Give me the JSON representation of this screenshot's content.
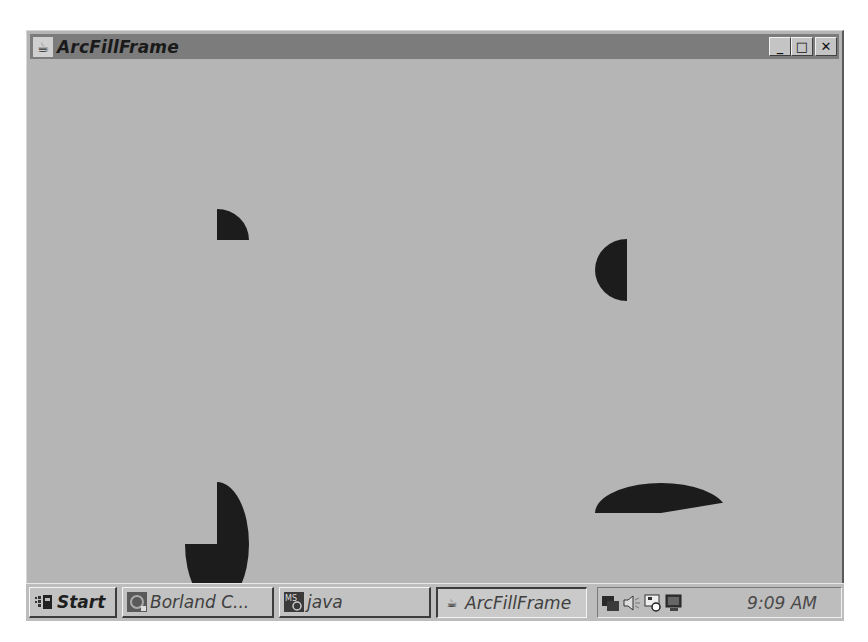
{
  "window": {
    "title": "ArcFillFrame",
    "icon": "java-coffee-cup-icon",
    "controls": {
      "minimize": "_",
      "maximize": "□",
      "close": "✕"
    },
    "colors": {
      "titlebar": "#7c7c7c",
      "client_background": "#b5b5b5",
      "arc_fill": "#1c1c1c"
    }
  },
  "canvas": {
    "arcs": [
      {
        "name": "quarter-arc",
        "cx": 187,
        "cy": 181,
        "rx": 32,
        "ry": 31,
        "start_deg": 0,
        "sweep_deg": 90
      },
      {
        "name": "half-arc",
        "cx": 597,
        "cy": 211,
        "rx": 32,
        "ry": 31,
        "start_deg": 90,
        "sweep_deg": 180
      },
      {
        "name": "three-quarter-arc",
        "cx": 187,
        "cy": 485,
        "rx": 32,
        "ry": 62,
        "start_deg": 90,
        "sweep_deg": -270
      },
      {
        "name": "wide-arc",
        "cx": 631,
        "cy": 454,
        "rx": 66,
        "ry": 30,
        "start_deg": 20,
        "sweep_deg": 160
      }
    ]
  },
  "taskbar": {
    "start_label": "Start",
    "buttons": [
      {
        "label": "Borland C...",
        "icon": "borland-icon",
        "active": false
      },
      {
        "label": "java",
        "icon": "msdos-icon",
        "active": false
      },
      {
        "label": "ArcFillFrame",
        "icon": "java-coffee-cup-icon",
        "active": true
      }
    ],
    "tray_icons": [
      "network-icon",
      "speaker-icon",
      "scheduler-icon",
      "display-icon"
    ],
    "clock": "9:09 AM"
  }
}
